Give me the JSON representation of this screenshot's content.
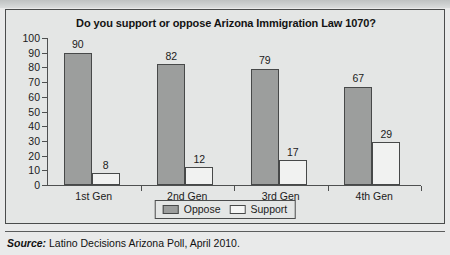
{
  "top_strip": {
    "ghost_text": ""
  },
  "figure": {
    "title": "Do you support or oppose Arizona Immigration Law 1070?",
    "source_label": "Source:",
    "source_body": " Latino Decisions Arizona Poll, April 2010."
  },
  "legend": {
    "position": "bottom-center",
    "items": [
      {
        "label": "Oppose",
        "color": "#9c9e9d"
      },
      {
        "label": "Support",
        "color": "#f5f6f5"
      }
    ]
  },
  "chart_data": {
    "type": "bar",
    "title": "Do you support or oppose Arizona Immigration Law 1070?",
    "xlabel": "",
    "ylabel": "",
    "ylim": [
      0,
      100
    ],
    "yticks": [
      0,
      10,
      20,
      30,
      40,
      50,
      60,
      70,
      80,
      90,
      100
    ],
    "grid": false,
    "legend_position": "bottom-center",
    "categories": [
      "1st Gen",
      "2nd Gen",
      "3rd Gen",
      "4th Gen"
    ],
    "series": [
      {
        "name": "Oppose",
        "color": "#9c9e9d",
        "values": [
          90,
          82,
          79,
          67
        ]
      },
      {
        "name": "Support",
        "color": "#f5f6f5",
        "values": [
          8,
          12,
          17,
          29
        ]
      }
    ],
    "annotations": [
      "Source: Latino Decisions Arizona Poll, April 2010."
    ]
  }
}
